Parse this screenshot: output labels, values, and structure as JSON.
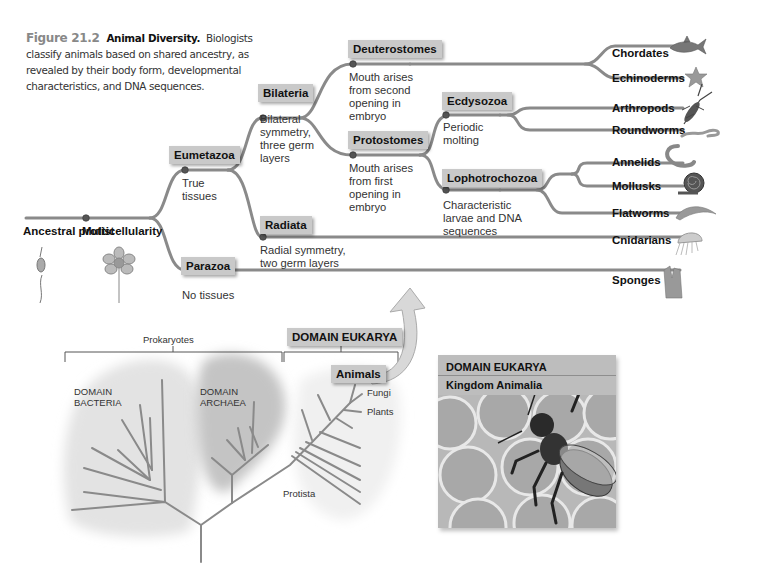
{
  "caption": {
    "figure_number": "Figure 21.2",
    "title": "Animal Diversity.",
    "text": "Biologists classify animals based on shared ancestry, as revealed by their body form, developmental characteristics, and DNA sequences."
  },
  "tree": {
    "root": {
      "label": "Ancestral protist"
    },
    "nodes": {
      "multicellularity": {
        "label": "Multicellularity"
      },
      "eumetazoa": {
        "label": "Eumetazoa",
        "desc": "True tissues"
      },
      "parazoa": {
        "label": "Parazoa",
        "desc": "No tissues"
      },
      "bilateria": {
        "label": "Bilateria",
        "desc": "Bilateral symmetry, three germ layers"
      },
      "radiata": {
        "label": "Radiata",
        "desc": "Radial symmetry, two germ layers"
      },
      "deuterostomes": {
        "label": "Deuterostomes",
        "desc": "Mouth arises from second opening in embryo"
      },
      "protostomes": {
        "label": "Protostomes",
        "desc": "Mouth arises from first opening in embryo"
      },
      "ecdysozoa": {
        "label": "Ecdysozoa",
        "desc": "Periodic molting"
      },
      "lophotrochozoa": {
        "label": "Lophotrochozoa",
        "desc": "Characteristic larvae and DNA sequences"
      }
    },
    "tips": [
      {
        "label": "Chordates",
        "icon": "shark-icon"
      },
      {
        "label": "Echinoderms",
        "icon": "starfish-icon"
      },
      {
        "label": "Arthropods",
        "icon": "lobster-icon"
      },
      {
        "label": "Roundworms",
        "icon": "roundworm-icon"
      },
      {
        "label": "Annelids",
        "icon": "earthworm-icon"
      },
      {
        "label": "Mollusks",
        "icon": "snail-icon"
      },
      {
        "label": "Flatworms",
        "icon": "flatworm-icon"
      },
      {
        "label": "Cnidarians",
        "icon": "jellyfish-icon"
      },
      {
        "label": "Sponges",
        "icon": "sponge-icon"
      }
    ]
  },
  "tree_of_life": {
    "prokaryotes_label": "Prokaryotes",
    "eukarya_label": "DOMAIN EUKARYA",
    "bacteria_label": "DOMAIN BACTERIA",
    "bacteria_line1": "DOMAIN",
    "bacteria_line2": "BACTERIA",
    "archaea_line1": "DOMAIN",
    "archaea_line2": "ARCHAEA",
    "animals_label": "Animals",
    "fungi_label": "Fungi",
    "plants_label": "Plants",
    "protista_label": "Protista"
  },
  "photo": {
    "domain": "DOMAIN EUKARYA",
    "kingdom": "Kingdom Animalia",
    "subject": "honeybee-on-honeycomb"
  },
  "colors": {
    "branch": "#8a8a8a",
    "label_box": "#c9c9c9",
    "node_dot": "#555555",
    "bacteria_blob": "#e3e3e3",
    "archaea_blob": "#c4c4c4",
    "eukarya_blob": "#f0f0f0"
  }
}
